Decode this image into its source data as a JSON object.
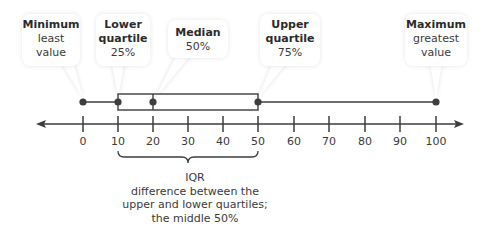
{
  "diagram": {
    "type": "box-plot-explanation",
    "callouts": [
      {
        "id": "minimum",
        "title": "Minimum",
        "lines": [
          "least",
          "value"
        ]
      },
      {
        "id": "lower-quartile",
        "title": "Lower quartile",
        "title_lines": [
          "Lower",
          "quartile"
        ],
        "lines": [
          "25%"
        ]
      },
      {
        "id": "median",
        "title": "Median",
        "lines": [
          "50%"
        ]
      },
      {
        "id": "upper-quartile",
        "title": "Upper quartile",
        "title_lines": [
          "Upper",
          "quartile"
        ],
        "lines": [
          "75%"
        ]
      },
      {
        "id": "maximum",
        "title": "Maximum",
        "lines": [
          "greatest",
          "value"
        ]
      }
    ],
    "axis": {
      "ticks": [
        "0",
        "10",
        "20",
        "30",
        "40",
        "50",
        "60",
        "70",
        "80",
        "90",
        "100"
      ],
      "min": 0,
      "max": 100,
      "arrows": "both"
    },
    "box_plot": {
      "minimum": 0,
      "lower_quartile": 10,
      "median": 20,
      "upper_quartile": 50,
      "maximum": 100
    },
    "iqr_annotation": {
      "label": "IQR",
      "lines": [
        "difference between the",
        "upper and lower quartiles;",
        "the middle 50%"
      ],
      "spans": [
        10,
        50
      ]
    },
    "colors": {
      "line": "#3d3d3d",
      "dot": "#3d3d3d",
      "text": "#3a3a3a",
      "callout_bg": "#ffffff"
    }
  }
}
